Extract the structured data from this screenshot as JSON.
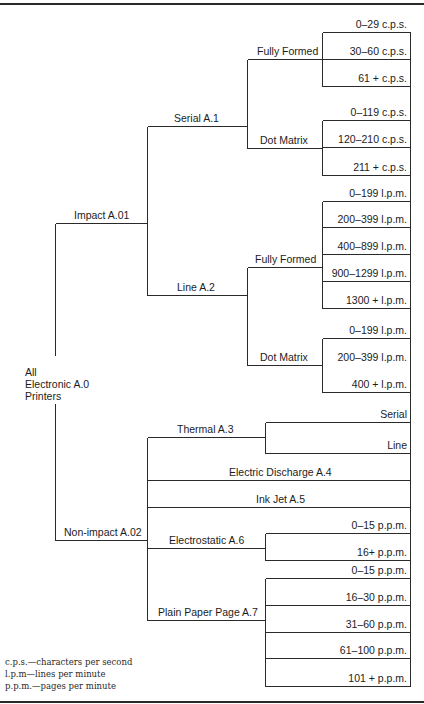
{
  "colors": {
    "line": "#2a2a2a",
    "text": "#1c1c1c",
    "background": "#ffffff"
  },
  "root": {
    "line1": "All",
    "line2": "Electronic A.0",
    "line3": "Printers"
  },
  "impact": {
    "label": "Impact A.01",
    "serial": {
      "label": "Serial A.1",
      "fully_formed": {
        "label": "Fully Formed",
        "ranges": [
          "0–29 c.p.s.",
          "30–60 c.p.s.",
          "61 + c.p.s."
        ]
      },
      "dot_matrix": {
        "label": "Dot Matrix",
        "ranges": [
          "0–119 c.p.s.",
          "120–210 c.p.s.",
          "211 + c.p.s."
        ]
      }
    },
    "line": {
      "label": "Line A.2",
      "fully_formed": {
        "label": "Fully Formed",
        "ranges": [
          "0–199 l.p.m.",
          "200–399 l.p.m.",
          "400–899 l.p.m.",
          "900–1299 l.p.m.",
          "1300 + l.p.m."
        ]
      },
      "dot_matrix": {
        "label": "Dot Matrix",
        "ranges": [
          "0–199 l.p.m.",
          "200–399 l.p.m.",
          "400 + l.p.m."
        ]
      }
    }
  },
  "non_impact": {
    "label": "Non-impact A.02",
    "thermal": {
      "label": "Thermal A.3",
      "types": [
        "Serial",
        "Line"
      ]
    },
    "electric_discharge": {
      "label": "Electric Discharge A.4"
    },
    "ink_jet": {
      "label": "Ink Jet A.5"
    },
    "electrostatic": {
      "label": "Electrostatic A.6",
      "ranges": [
        "0–15 p.p.m.",
        "16+ p.p.m."
      ]
    },
    "plain_paper": {
      "label": "Plain Paper Page A.7",
      "ranges": [
        "0–15 p.p.m.",
        "16–30 p.p.m.",
        "31–60 p.p.m.",
        "61–100 p.p.m.",
        "101 + p.p.m."
      ]
    }
  },
  "legend": [
    "c.p.s.—characters per second",
    "l.p.m—lines per minute",
    "p.p.m.—pages per minute"
  ]
}
